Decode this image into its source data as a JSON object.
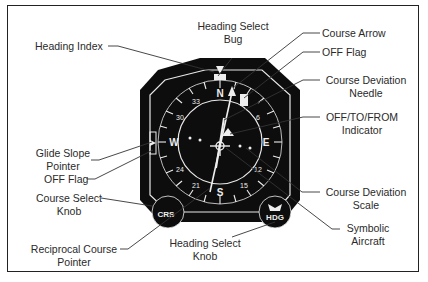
{
  "figure": {
    "labels": {
      "heading_index": "Heading Index",
      "heading_select_bug_1": "Heading Select",
      "heading_select_bug_2": "Bug",
      "course_arrow": "Course Arrow",
      "off_flag_top": "OFF Flag",
      "course_deviation_needle_1": "Course Deviation",
      "course_deviation_needle_2": "Needle",
      "off_to_from_1": "OFF/TO/FROM",
      "off_to_from_2": "Indicator",
      "glide_slope_1": "Glide Slope",
      "glide_slope_2": "Pointer",
      "off_flag_left": "OFF Flag",
      "course_select_1": "Course Select",
      "course_select_2": "Knob",
      "course_dev_scale_1": "Course Deviation",
      "course_dev_scale_2": "Scale",
      "reciprocal_1": "Reciprocal Course",
      "reciprocal_2": "Pointer",
      "heading_select_knob_1": "Heading Select",
      "heading_select_knob_2": "Knob",
      "symbolic_aircraft_1": "Symbolic",
      "symbolic_aircraft_2": "Aircraft"
    },
    "instrument": {
      "cardinal": {
        "n": "N",
        "e": "E",
        "s": "S",
        "w": "W"
      },
      "ticks": {
        "t33": "33",
        "t30": "30",
        "t24": "24",
        "t21": "21",
        "t15": "15",
        "t12": "12",
        "t6": "6",
        "t3": "3"
      },
      "crs_knob": "CRS",
      "hdg_knob": "HDG"
    },
    "colors": {
      "ink": "#111111",
      "paper": "#ffffff",
      "line": "#333333"
    }
  }
}
